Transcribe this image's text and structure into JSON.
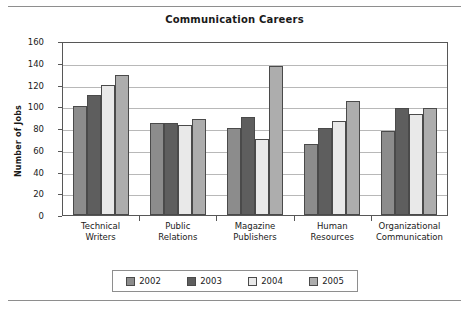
{
  "chart_data": {
    "type": "bar",
    "title": "Communication Careers",
    "xlabel": "",
    "ylabel": "Number of Jobs",
    "ylim": [
      0,
      160
    ],
    "yticks": [
      0,
      20,
      40,
      60,
      80,
      100,
      120,
      140,
      160
    ],
    "grid": true,
    "legend_position": "bottom",
    "categories": [
      "Technical Writers",
      "Public Relations",
      "Magazine Publishers",
      "Human Resources",
      "Organizational Communication"
    ],
    "category_lines": [
      [
        "Technical",
        "Writers"
      ],
      [
        "Public",
        "Relations"
      ],
      [
        "Magazine",
        "Publishers"
      ],
      [
        "Human",
        "Resources"
      ],
      [
        "Organizational",
        "Communication"
      ]
    ],
    "series": [
      {
        "name": "2002",
        "color": "#8c8c8c",
        "values": [
          100,
          85,
          80,
          65,
          77
        ]
      },
      {
        "name": "2003",
        "color": "#5e5e5e",
        "values": [
          110,
          85,
          90,
          80,
          98
        ]
      },
      {
        "name": "2004",
        "color": "#e9e9e9",
        "values": [
          120,
          83,
          70,
          86,
          93
        ]
      },
      {
        "name": "2005",
        "color": "#adadad",
        "values": [
          129,
          88,
          137,
          105,
          98
        ]
      }
    ]
  },
  "legend": {
    "items": [
      {
        "label": "2002",
        "color": "#8c8c8c"
      },
      {
        "label": "2003",
        "color": "#5e5e5e"
      },
      {
        "label": "2004",
        "color": "#e9e9e9"
      },
      {
        "label": "2005",
        "color": "#adadad"
      }
    ]
  }
}
